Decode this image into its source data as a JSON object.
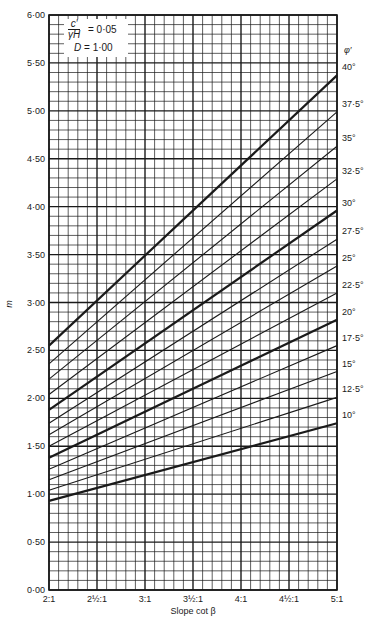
{
  "chart_data": {
    "type": "line",
    "title": "",
    "xlabel": "Slope cot β",
    "ylabel": "m",
    "xlim": [
      2,
      5
    ],
    "ylim": [
      0,
      6
    ],
    "grid": true,
    "x_ticks": [
      {
        "value": 2.0,
        "label": "2:1"
      },
      {
        "value": 2.5,
        "label": "2½:1"
      },
      {
        "value": 3.0,
        "label": "3:1"
      },
      {
        "value": 3.5,
        "label": "3½:1"
      },
      {
        "value": 4.0,
        "label": "4:1"
      },
      {
        "value": 4.5,
        "label": "4½:1"
      },
      {
        "value": 5.0,
        "label": "5:1"
      }
    ],
    "y_ticks": [
      {
        "value": 0.0,
        "label": "0·00"
      },
      {
        "value": 0.5,
        "label": "0·50"
      },
      {
        "value": 1.0,
        "label": "1·00"
      },
      {
        "value": 1.5,
        "label": "1·50"
      },
      {
        "value": 2.0,
        "label": "2·00"
      },
      {
        "value": 2.5,
        "label": "2·50"
      },
      {
        "value": 3.0,
        "label": "3·00"
      },
      {
        "value": 3.5,
        "label": "3·50"
      },
      {
        "value": 4.0,
        "label": "4·00"
      },
      {
        "value": 4.5,
        "label": "4·50"
      },
      {
        "value": 5.0,
        "label": "5·00"
      },
      {
        "value": 5.5,
        "label": "5·50"
      },
      {
        "value": 6.0,
        "label": "6·00"
      }
    ],
    "legend_title": "φ′",
    "legend_position": "right",
    "annotation": {
      "ratio_numerator": "c′",
      "ratio_denominator": "γH",
      "ratio_value": "= 0·05",
      "depth_label": "D",
      "depth_value": "= 1·00"
    },
    "x": [
      2,
      5
    ],
    "series": [
      {
        "name": "40°",
        "values": [
          2.55,
          5.37
        ],
        "bold": true
      },
      {
        "name": "37·5°",
        "values": [
          2.36,
          4.99
        ],
        "bold": false
      },
      {
        "name": "35°",
        "values": [
          2.2,
          4.63
        ],
        "bold": false
      },
      {
        "name": "32·5°",
        "values": [
          2.04,
          4.29
        ],
        "bold": false
      },
      {
        "name": "30°",
        "values": [
          1.88,
          3.96
        ],
        "bold": true
      },
      {
        "name": "27·5°",
        "values": [
          1.74,
          3.66
        ],
        "bold": false
      },
      {
        "name": "25°",
        "values": [
          1.62,
          3.38
        ],
        "bold": false
      },
      {
        "name": "22·5°",
        "values": [
          1.5,
          3.1
        ],
        "bold": false
      },
      {
        "name": "20°",
        "values": [
          1.38,
          2.82
        ],
        "bold": true
      },
      {
        "name": "17·5°",
        "values": [
          1.26,
          2.55
        ],
        "bold": false
      },
      {
        "name": "15°",
        "values": [
          1.15,
          2.28
        ],
        "bold": false
      },
      {
        "name": "12·5°",
        "values": [
          1.04,
          2.01
        ],
        "bold": false
      },
      {
        "name": "10°",
        "values": [
          0.93,
          1.74
        ],
        "bold": true
      }
    ],
    "colors": {
      "line": "#1a1a1a",
      "grid": "#1a1a1a",
      "background": "#ffffff"
    }
  }
}
